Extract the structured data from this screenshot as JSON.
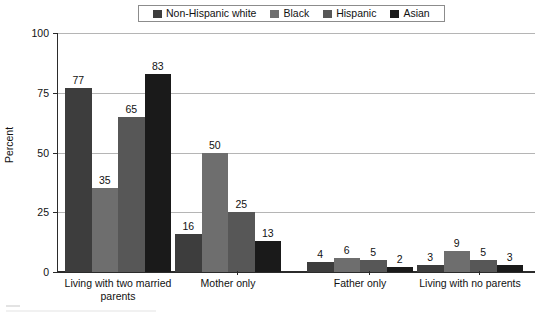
{
  "chart_data": {
    "type": "bar",
    "title": "",
    "xlabel": "",
    "ylabel": "Percent",
    "ylim": [
      0,
      100
    ],
    "yticks": [
      0,
      25,
      50,
      75,
      100
    ],
    "grid": "horizontal",
    "legend_position": "top",
    "categories": [
      "Living with two married parents",
      "Mother only",
      "Father only",
      "Living with no parents"
    ],
    "category_lines": [
      [
        "Living with two married",
        "parents"
      ],
      [
        "Mother only"
      ],
      [
        "Father only"
      ],
      [
        "Living with no parents"
      ]
    ],
    "series": [
      {
        "name": "Non-Hispanic white",
        "color": "#3d3d3d",
        "values": [
          77,
          16,
          4,
          3
        ]
      },
      {
        "name": "Black",
        "color": "#6e6e6e",
        "values": [
          35,
          50,
          6,
          9
        ]
      },
      {
        "name": "Hispanic",
        "color": "#575757",
        "values": [
          65,
          25,
          5,
          5
        ]
      },
      {
        "name": "Asian",
        "color": "#1a1a1a",
        "values": [
          83,
          13,
          2,
          3
        ]
      }
    ]
  },
  "legend": {
    "items": [
      {
        "label": "Non-Hispanic white",
        "color": "#3d3d3d",
        "icon": "legend-swatch-icon"
      },
      {
        "label": "Black",
        "color": "#6e6e6e",
        "icon": "legend-swatch-icon"
      },
      {
        "label": "Hispanic",
        "color": "#575757",
        "icon": "legend-swatch-icon"
      },
      {
        "label": "Asian",
        "color": "#1a1a1a",
        "icon": "legend-swatch-icon"
      }
    ]
  },
  "axis": {
    "y_title": "Percent",
    "y_tick_labels": [
      "100",
      "75",
      "50",
      "25",
      "0"
    ]
  }
}
